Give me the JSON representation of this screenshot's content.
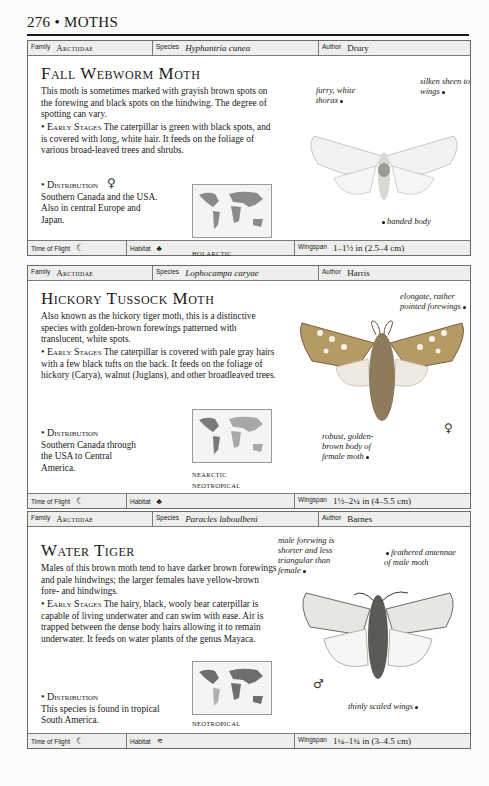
{
  "page": {
    "number": "276",
    "separator": "•",
    "section": "MOTHS"
  },
  "labels": {
    "family": "Family",
    "species": "Species",
    "author": "Author",
    "time_of_flight": "Time of Flight",
    "habitat": "Habitat",
    "wingspan": "Wingspan"
  },
  "entries": [
    {
      "family": "Arctiidae",
      "species": "Hyphantria cunea",
      "author": "Drury",
      "common_name": "Fall Webworm Moth",
      "description": "This moth is sometimes marked with grayish brown spots on the forewing and black spots on the hindwing. The degree of spotting can vary.",
      "early_stages_heading": "• Early Stages",
      "early_stages": "The caterpillar is green with black spots, and is covered with long, white hair. It feeds on the foliage of various broad-leaved trees and shrubs.",
      "distribution_heading": "• Distribution",
      "distribution": "Southern Canada and the USA. Also in central Europe and Japan.",
      "map_regions": [
        "HOLARCTIC"
      ],
      "annotations": [
        "furry, white thorax",
        "silken sheen to wings",
        "banded body"
      ],
      "sex_symbol": "♀",
      "time_of_flight_icon": "crescent-moon-icon",
      "habitat_icon": "tree-icon",
      "wingspan": "1–1½ in (2.5–4 cm)"
    },
    {
      "family": "Arctiidae",
      "species": "Lophocampa caryae",
      "author": "Harris",
      "common_name": "Hickory Tussock Moth",
      "description": "Also known as the hickory tiger moth, this is a distinctive species with golden-brown forewings patterned with translucent, white spots.",
      "early_stages_heading": "• Early Stages",
      "early_stages": "The caterpillar is covered with pale gray hairs with a few black tufts on the back. It feeds on the foliage of hickory (Carya), walnut (Juglans), and other broadleaved trees.",
      "distribution_heading": "• Distribution",
      "distribution": "Southern Canada through the USA to Central America.",
      "map_regions": [
        "NEARCTIC",
        "NEOTROPICAL"
      ],
      "annotations": [
        "elongate, rather pointed forewings",
        "robust, golden-brown body of female moth"
      ],
      "sex_symbol": "♀",
      "time_of_flight_icon": "crescent-moon-icon",
      "habitat_icon": "tree-icon",
      "wingspan": "1½–2¼ in (4–5.5 cm)"
    },
    {
      "family": "Arctiidae",
      "species": "Paracles laboulbeni",
      "author": "Barnes",
      "common_name": "Water Tiger",
      "description": "Males of this brown moth tend to have darker brown forewings and pale hindwings; the larger females have yellow-brown fore- and hindwings.",
      "early_stages_heading": "• Early Stages",
      "early_stages": "The hairy, black, wooly bear caterpillar is capable of living underwater and can swim with ease. Air is trapped between the dense body hairs allowing it to remain underwater. It feeds on water plants of the genus Mayaca.",
      "distribution_heading": "• Distribution",
      "distribution": "This species is found in tropical South America.",
      "map_regions": [
        "NEOTROPICAL"
      ],
      "annotations": [
        "male forewing is shorter and less triangular than female",
        "feathered antennae of male moth",
        "thinly scaled wings"
      ],
      "sex_symbol": "♂",
      "time_of_flight_icon": "crescent-moon-icon",
      "habitat_icon": "wetland-icon",
      "wingspan": "1¼–1¾ in (3–4.5 cm)"
    }
  ]
}
